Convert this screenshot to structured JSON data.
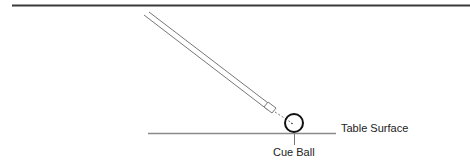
{
  "diagram": {
    "labels": {
      "table_surface": "Table Surface",
      "cue_ball": "Cue Ball"
    },
    "elements": {
      "top_rule": {
        "x1": 12,
        "y1": 5,
        "x2": 470,
        "y2": 5,
        "color": "#333333"
      },
      "cue_stick": {
        "from": [
          146,
          13
        ],
        "to": [
          273,
          112
        ],
        "color": "#666666"
      },
      "aim_line": {
        "from": [
          273,
          112
        ],
        "to": [
          291,
          123
        ],
        "style": "dashed"
      },
      "cue_ball": {
        "cx": 294,
        "cy": 123,
        "r": 9,
        "color": "#111111"
      },
      "table_surface_line": {
        "x1": 148,
        "y1": 133,
        "x2": 336,
        "y2": 133,
        "color": "#888888"
      },
      "ball_leader_line": {
        "x": 294,
        "y1": 133,
        "y2": 145
      }
    }
  }
}
